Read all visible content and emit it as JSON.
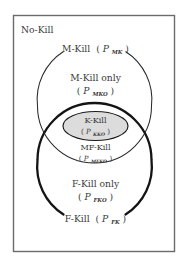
{
  "figure": {
    "name": "kill-categories-venn-diagram",
    "background_color": "#ffffff",
    "frame_color": "#6b6b6b",
    "universe_label": "No-Kill"
  },
  "sets": {
    "m_kill": {
      "label": "M-Kill",
      "symbol_base": "P",
      "symbol_sub": "MK",
      "open_paren": "(",
      "close_paren": ")",
      "stroke_style": "thin",
      "stroke_color": "#2a2a2a"
    },
    "m_kill_only": {
      "label": "M-Kill only",
      "symbol_base": "P",
      "symbol_sub": "MKO",
      "open_paren": "(",
      "close_paren": ")"
    },
    "k_kill": {
      "label": "K-Kill",
      "symbol_base": "P",
      "symbol_sub": "KKO",
      "open_paren": "(",
      "close_paren": ")",
      "fill_color": "#dcdcdc"
    },
    "mf_kill": {
      "label": "MF-Kill",
      "symbol_base": "P",
      "symbol_sub": "MFKO",
      "open_paren": "(",
      "close_paren": ")"
    },
    "f_kill_only": {
      "label": "F-Kill only",
      "symbol_base": "P",
      "symbol_sub": "FKO",
      "open_paren": "(",
      "close_paren": ")"
    },
    "f_kill": {
      "label": "F-Kill",
      "symbol_base": "P",
      "symbol_sub": "FK",
      "open_paren": "(",
      "close_paren": ")",
      "stroke_style": "thick",
      "stroke_color": "#141414"
    }
  }
}
